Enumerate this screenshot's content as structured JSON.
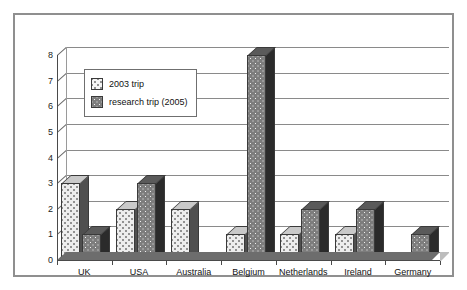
{
  "chart_data": {
    "type": "bar",
    "title": "",
    "subtitle": "",
    "xlabel": "",
    "ylabel": "",
    "ylim": [
      0,
      8
    ],
    "ytick_step": 1,
    "yticks": [
      8,
      7,
      6,
      5,
      4,
      3,
      2,
      1,
      0
    ],
    "grid": true,
    "grid_orientation": "horizontal",
    "legend_position": "upper-left-inside",
    "style": "3d-clustered-column",
    "categories": [
      "UK",
      "USA",
      "Australia",
      "Belgium",
      "Netherlands",
      "Ireland",
      "Germany"
    ],
    "series": [
      {
        "name": "2003 trip",
        "pattern": "light-dotted",
        "color": "#ededed",
        "values": [
          3,
          2,
          2,
          1,
          1,
          1,
          0
        ]
      },
      {
        "name": "research trip (2005)",
        "pattern": "dark-dotted",
        "color": "#7d7d7d",
        "values": [
          1,
          3,
          0,
          8,
          2,
          2,
          1
        ]
      }
    ]
  },
  "legend": {
    "entries": [
      {
        "label": "2003 trip",
        "swatch": "light-dotted-swatch"
      },
      {
        "label": "research trip (2005)",
        "swatch": "dark-dotted-swatch"
      }
    ]
  },
  "colors": {
    "frame": "#8f8f8f",
    "axis": "#4a4a4a",
    "grid": "#8a8a8a",
    "series_2003": "#ededed",
    "series_2005": "#7d7d7d",
    "background": "#ffffff"
  }
}
